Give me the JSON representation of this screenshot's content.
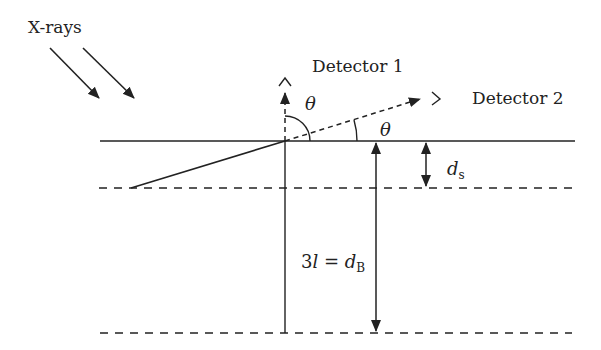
{
  "diagram": {
    "xrays_label": "X-rays",
    "detector1_label": "Detector 1",
    "detector2_label": "Detector 2",
    "theta_symbol": "θ",
    "ds_main": "d",
    "ds_sub": "s",
    "db_prefix": "3",
    "db_l": "l",
    "db_eq": " = ",
    "db_main": "d",
    "db_sub": "B",
    "colors": {
      "line": "#222222",
      "background": "#ffffff"
    }
  }
}
